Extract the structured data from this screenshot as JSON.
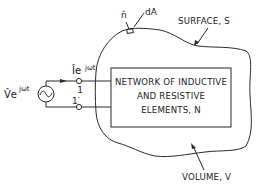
{
  "diagram": {
    "source_label": "V̂e",
    "source_exp": "jωt",
    "current_label": "Îe",
    "current_exp": "jωt",
    "terminal_top": "1",
    "terminal_bottom": "1′",
    "normal_label": "n̂",
    "area_label": "dA",
    "surface_label": "SURFACE, S",
    "volume_label": "VOLUME, V",
    "box_lines": [
      "NETWORK OF INDUCTIVE",
      "AND RESISTIVE",
      "ELEMENTS, N"
    ]
  }
}
